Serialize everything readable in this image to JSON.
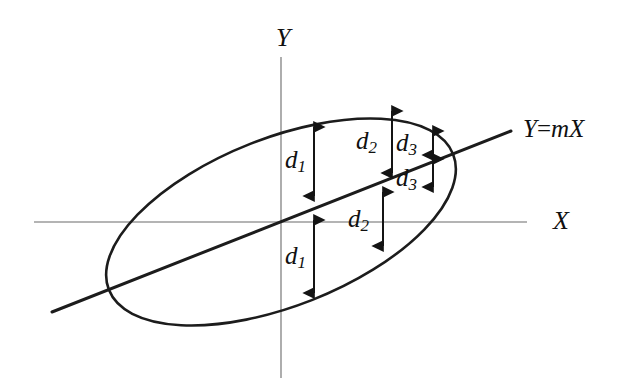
{
  "figure": {
    "background_color": "#ffffff",
    "ink_color": "#1c1c1c",
    "axis_color": "#6b6b6b"
  },
  "axes": {
    "x_axis": {
      "label": "X",
      "label_x": 553,
      "label_y": 223,
      "x1": 34,
      "x2": 527,
      "y": 222
    },
    "y_axis": {
      "label": "Y",
      "label_x": 276,
      "label_y": 40,
      "x": 281,
      "y1": 57,
      "y2": 378
    },
    "origin": {
      "x": 281,
      "y": 222
    }
  },
  "line": {
    "label": "Y=mX",
    "label_lhs": "Y",
    "label_op": "=",
    "label_slope": "m",
    "label_var": "X",
    "label_x": 523,
    "label_y": 131,
    "slope": 0.393,
    "x1": 52,
    "y1": 312,
    "x2": 511,
    "y2": 131
  },
  "ellipse": {
    "center_x": 281,
    "center_y": 222,
    "semi_major": 185,
    "semi_minor": 84,
    "rotation_deg": -21.5
  },
  "measures": [
    {
      "id": "d1-upper",
      "label": "d",
      "subscript": "1",
      "arrow_x": 314,
      "y_top": 127,
      "y_bottom": 196,
      "label_x": 294,
      "label_y": 162,
      "double_headed": true,
      "description": "vertical distance from ellipse top edge to X axis above origin"
    },
    {
      "id": "d1-lower",
      "label": "d",
      "subscript": "1",
      "arrow_x": 314,
      "y_top": 220,
      "y_bottom": 293,
      "label_x": 294,
      "label_y": 258,
      "double_headed": true,
      "description": "vertical distance from X axis to ellipse bottom edge below origin"
    },
    {
      "id": "d2-upper",
      "label": "d",
      "subscript": "2",
      "arrow_x": 392,
      "y_top": 111,
      "y_bottom": 173,
      "label_x": 365,
      "label_y": 143,
      "double_headed": true,
      "description": "vertical distance from ellipse top edge down to the regression line"
    },
    {
      "id": "d2-lower",
      "label": "d",
      "subscript": "2",
      "arrow_x": 383,
      "y_top": 192,
      "y_bottom": 246,
      "label_x": 360,
      "label_y": 221,
      "double_headed": true,
      "description": "vertical distance from the regression line down to the X axis region"
    },
    {
      "id": "d3-upper",
      "label": "d",
      "subscript": "3",
      "arrow_x": 433,
      "y_top": 131,
      "y_bottom": 155,
      "label_x": 404,
      "label_y": 145,
      "double_headed": true,
      "description": "small vertical distance from ellipse top edge to regression line near right end"
    },
    {
      "id": "d3-lower",
      "label": "d",
      "subscript": "3",
      "arrow_x": 433,
      "y_top": 159,
      "y_bottom": 187,
      "label_x": 404,
      "label_y": 180,
      "double_headed": true,
      "description": "small vertical distance from regression line to ellipse bottom edge near right end"
    }
  ]
}
